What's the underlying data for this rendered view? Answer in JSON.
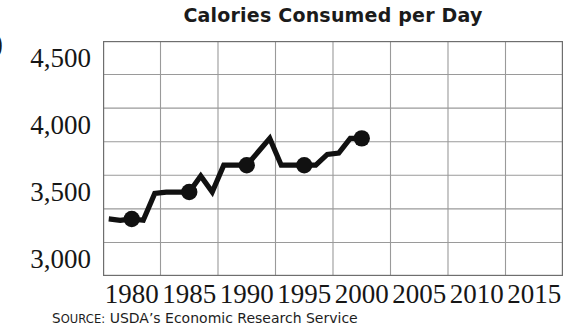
{
  "figure": {
    "crop_glyph": ")",
    "source_prefix_cap": "S",
    "source_prefix_rest": "OURCE:",
    "source_text": "USDA’s Economic Research Service"
  },
  "chart_data": {
    "type": "line",
    "title": "Calories Consumed per Day",
    "xlabel": "",
    "ylabel": "",
    "grid": true,
    "legend": "none",
    "xlim": [
      1977.5,
      2017.5
    ],
    "ylim": [
      2875,
      4625
    ],
    "ytick_labels": [
      "4,500",
      "4,000",
      "3,500",
      "3,000"
    ],
    "ytick_values": [
      4500,
      4000,
      3500,
      3000
    ],
    "y_gridline_values": [
      4625,
      4375,
      4125,
      3875,
      3625,
      3375,
      3125,
      2875
    ],
    "xtick_labels": [
      "1980",
      "1985",
      "1990",
      "1995",
      "2000",
      "2005",
      "2010",
      "2015"
    ],
    "xtick_values": [
      1980,
      1985,
      1990,
      1995,
      2000,
      2005,
      2010,
      2015
    ],
    "marker_years": [
      1980,
      1985,
      1990,
      1995,
      2000
    ],
    "marker_values": [
      3300,
      3500,
      3700,
      3700,
      3900
    ],
    "x": [
      1978,
      1979,
      1980,
      1981,
      1982,
      1983,
      1984,
      1985,
      1986,
      1987,
      1988,
      1989,
      1990,
      1991,
      1992,
      1993,
      1994,
      1995,
      1996,
      1997,
      1998,
      1999,
      2000
    ],
    "values": [
      3300,
      3290,
      3300,
      3290,
      3490,
      3500,
      3500,
      3500,
      3620,
      3500,
      3700,
      3700,
      3700,
      3800,
      3900,
      3700,
      3700,
      3700,
      3700,
      3780,
      3790,
      3900,
      3900
    ],
    "series": [
      {
        "name": "Calories consumed per day",
        "values": [
          3300,
          3290,
          3300,
          3290,
          3490,
          3500,
          3500,
          3500,
          3620,
          3500,
          3700,
          3700,
          3700,
          3800,
          3900,
          3700,
          3700,
          3700,
          3700,
          3780,
          3790,
          3900,
          3900
        ]
      }
    ],
    "line_color": "#111111",
    "marker_color": "#111111",
    "grid_color": "#9a9a9a",
    "axis_color": "#6e6e6e"
  }
}
